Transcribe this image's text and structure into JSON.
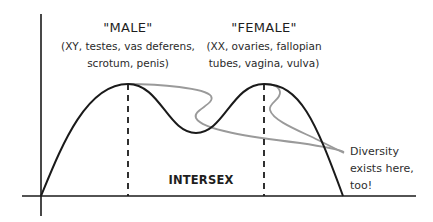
{
  "diagram": {
    "type": "bimodal-distribution",
    "peaks": [
      {
        "title": "\"MALE\"",
        "details_line1": "(XY, testes, vas deferens,",
        "details_line2": "scrotum, penis)"
      },
      {
        "title": "\"FEMALE\"",
        "details_line1": "(XX, ovaries, fallopian",
        "details_line2": "tubes, vagina, vulva)"
      }
    ],
    "middle_label": "INTERSEX",
    "annotation": {
      "line1": "Diversity",
      "line2": "exists here,",
      "line3": "too!"
    },
    "colors": {
      "main_curve": "#1a1a1a",
      "diversity_curve": "#9a9a9a",
      "axes": "#1a1a1a",
      "background": "#ffffff"
    }
  }
}
